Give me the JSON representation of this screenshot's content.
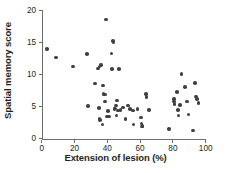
{
  "chart_data": {
    "type": "scatter",
    "title": "",
    "xlabel": "Extension of lesion (%)",
    "ylabel": "Spatial memory score",
    "xlim": [
      0,
      100
    ],
    "ylim": [
      0,
      20
    ],
    "xticks": [
      0,
      20,
      40,
      60,
      80,
      100
    ],
    "yticks": [
      0,
      5,
      10,
      15,
      20
    ],
    "grid": false,
    "legend": null,
    "marker": {
      "shape": "circle",
      "color": "#414042",
      "size_px": 3.6
    },
    "axis_color": "#6d6e71",
    "points": [
      {
        "x": 3.4,
        "y": 14.0
      },
      {
        "x": 8.6,
        "y": 12.7
      },
      {
        "x": 19.0,
        "y": 11.3
      },
      {
        "x": 27.8,
        "y": 13.2
      },
      {
        "x": 28.2,
        "y": 5.1
      },
      {
        "x": 32.5,
        "y": 8.6
      },
      {
        "x": 34.4,
        "y": 11.0
      },
      {
        "x": 35.3,
        "y": 11.3
      },
      {
        "x": 36.0,
        "y": 11.5
      },
      {
        "x": 34.8,
        "y": 4.8
      },
      {
        "x": 35.2,
        "y": 3.1
      },
      {
        "x": 35.6,
        "y": 2.9
      },
      {
        "x": 37.0,
        "y": 2.2
      },
      {
        "x": 37.4,
        "y": 8.3
      },
      {
        "x": 37.8,
        "y": 7.0
      },
      {
        "x": 38.5,
        "y": 6.9
      },
      {
        "x": 38.6,
        "y": 5.8
      },
      {
        "x": 39.3,
        "y": 18.6
      },
      {
        "x": 39.8,
        "y": 3.5
      },
      {
        "x": 40.5,
        "y": 4.3
      },
      {
        "x": 41.2,
        "y": 3.5
      },
      {
        "x": 42.5,
        "y": 13.3
      },
      {
        "x": 43.0,
        "y": 10.9
      },
      {
        "x": 43.6,
        "y": 15.3
      },
      {
        "x": 43.9,
        "y": 15.0
      },
      {
        "x": 44.3,
        "y": 4.6
      },
      {
        "x": 44.8,
        "y": 4.7
      },
      {
        "x": 45.3,
        "y": 5.2
      },
      {
        "x": 45.6,
        "y": 3.6
      },
      {
        "x": 46.0,
        "y": 6.0
      },
      {
        "x": 46.5,
        "y": 4.4
      },
      {
        "x": 47.2,
        "y": 10.9
      },
      {
        "x": 48.0,
        "y": 4.5
      },
      {
        "x": 49.5,
        "y": 4.9
      },
      {
        "x": 51.0,
        "y": 3.1
      },
      {
        "x": 52.5,
        "y": 5.2
      },
      {
        "x": 54.0,
        "y": 4.6
      },
      {
        "x": 55.5,
        "y": 4.4
      },
      {
        "x": 56.0,
        "y": 2.2
      },
      {
        "x": 58.5,
        "y": 4.6
      },
      {
        "x": 60.5,
        "y": 3.3
      },
      {
        "x": 60.8,
        "y": 2.4
      },
      {
        "x": 61.0,
        "y": 1.9
      },
      {
        "x": 61.5,
        "y": 2.0
      },
      {
        "x": 63.5,
        "y": 7.0
      },
      {
        "x": 63.8,
        "y": 6.5
      },
      {
        "x": 65.5,
        "y": 4.5
      },
      {
        "x": 77.5,
        "y": 1.5
      },
      {
        "x": 80.5,
        "y": 6.2
      },
      {
        "x": 80.8,
        "y": 5.8
      },
      {
        "x": 81.0,
        "y": 5.4
      },
      {
        "x": 82.5,
        "y": 7.3
      },
      {
        "x": 83.0,
        "y": 4.5
      },
      {
        "x": 83.5,
        "y": 3.6
      },
      {
        "x": 84.5,
        "y": 5.3
      },
      {
        "x": 85.3,
        "y": 10.1
      },
      {
        "x": 87.5,
        "y": 8.1
      },
      {
        "x": 88.5,
        "y": 5.8
      },
      {
        "x": 89.5,
        "y": 3.8
      },
      {
        "x": 92.3,
        "y": 1.3
      },
      {
        "x": 93.5,
        "y": 8.7
      },
      {
        "x": 94.0,
        "y": 6.6
      },
      {
        "x": 94.8,
        "y": 6.2
      },
      {
        "x": 95.5,
        "y": 5.6
      }
    ]
  }
}
